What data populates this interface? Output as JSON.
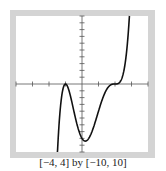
{
  "caption": "[−4, 4] by [−10, 10]",
  "colors": {
    "frame": "#d0d0d0",
    "axis": "#555555",
    "curve": "#111111",
    "background": "#ffffff"
  },
  "chart_data": {
    "type": "line",
    "title": "",
    "xlabel": "",
    "ylabel": "",
    "xlim": [
      -4,
      4
    ],
    "ylim": [
      -10,
      10
    ],
    "x_tick_step": 1,
    "y_tick_step": 1,
    "grid": false,
    "legend": null,
    "window_caption": "[−4, 4] by [−10, 10]",
    "function": "f(x) = (x+1)^2 (x-2)^3",
    "series": [
      {
        "name": "f(x)",
        "x": [
          -1.4,
          -1.3,
          -1.2,
          -1.1,
          -1.0,
          -0.8,
          -0.6,
          -0.4,
          -0.2,
          0.0,
          0.2,
          0.4,
          0.6,
          0.8,
          1.0,
          1.2,
          1.4,
          1.6,
          1.8,
          2.0,
          2.2,
          2.4,
          2.6,
          2.7,
          2.76
        ],
        "values": [
          -6.28,
          -3.23,
          -1.26,
          -0.28,
          0.0,
          -0.88,
          -3.32,
          -6.75,
          -10.0,
          -8.0,
          -7.61,
          -7.9,
          -7.13,
          -5.27,
          -4.0,
          -2.48,
          -1.25,
          -0.44,
          -0.08,
          0.0,
          0.08,
          0.75,
          2.93,
          4.72,
          6.2
        ]
      }
    ],
    "key_points": [
      {
        "label": "local max (double root)",
        "x": -1,
        "y": 0
      },
      {
        "label": "local min",
        "x": 0.4,
        "y": -8.8
      },
      {
        "label": "inflection (triple root)",
        "x": 2,
        "y": 0
      }
    ]
  }
}
